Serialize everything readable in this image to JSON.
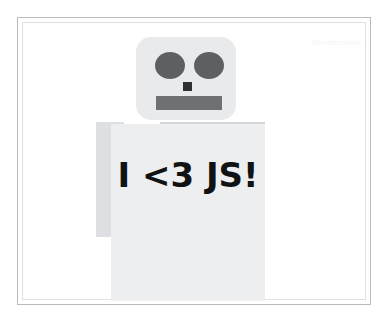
{
  "canvas": {
    "width": 389,
    "height": 325,
    "background": "#ffffff"
  },
  "frame": {
    "outer_border_color": "#b9bcc0",
    "inner_border_color": "#dfe1e4"
  },
  "watermark": {
    "text": "Shutterstock",
    "color": "#f3f4f6"
  },
  "illustration": {
    "subject": "robot",
    "slogan": "I <3 JS!",
    "slogan_color": "#111214",
    "colors": {
      "head": "#e9eaec",
      "eye": "#5d5f62",
      "nose": "#2e3033",
      "mouth": "#6e7074",
      "shoulder": "#d4d6d9",
      "arm_left": "#dddfe2",
      "torso": "#eceef0"
    },
    "parts": [
      {
        "name": "head",
        "label": "Robot head"
      },
      {
        "name": "eye-left",
        "label": "Left eye"
      },
      {
        "name": "eye-right",
        "label": "Right eye"
      },
      {
        "name": "nose",
        "label": "Nose"
      },
      {
        "name": "mouth",
        "label": "Mouth"
      },
      {
        "name": "shoulder",
        "label": "Shoulder bar"
      },
      {
        "name": "arm-left",
        "label": "Left arm"
      },
      {
        "name": "torso",
        "label": "Torso"
      }
    ]
  }
}
